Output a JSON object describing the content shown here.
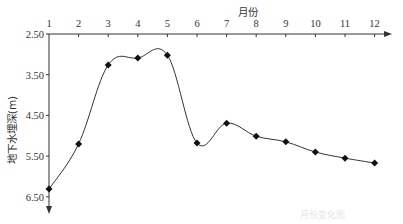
{
  "chart_data": {
    "type": "line",
    "title": "",
    "xlabel": "月份",
    "ylabel": "地下水埋深(m)",
    "x": [
      1,
      2,
      3,
      4,
      5,
      6,
      7,
      8,
      9,
      10,
      11,
      12
    ],
    "x_tick_labels": [
      "1",
      "2",
      "3",
      "4",
      "5",
      "6",
      "7",
      "8",
      "9",
      "10",
      "11",
      "12"
    ],
    "y_tick_labels": [
      "2.50",
      "3.50",
      "4.50",
      "5.50",
      "6.50"
    ],
    "y_ticks": [
      2.5,
      3.5,
      4.5,
      5.5,
      6.5
    ],
    "series": [
      {
        "name": "地下水埋深",
        "values": [
          6.31,
          5.2,
          3.26,
          3.09,
          3.02,
          5.18,
          4.69,
          5.01,
          5.15,
          5.4,
          5.55,
          5.67
        ],
        "marker": "diamond",
        "smooth": true
      }
    ],
    "ylim": [
      2.5,
      6.5
    ],
    "y_inverted": true,
    "x_axis_position": "top",
    "grid": false,
    "legend": "none"
  },
  "caption": "月份变化图",
  "colors": {
    "line": "#333333",
    "marker": "#111111",
    "axis": "#333333"
  }
}
